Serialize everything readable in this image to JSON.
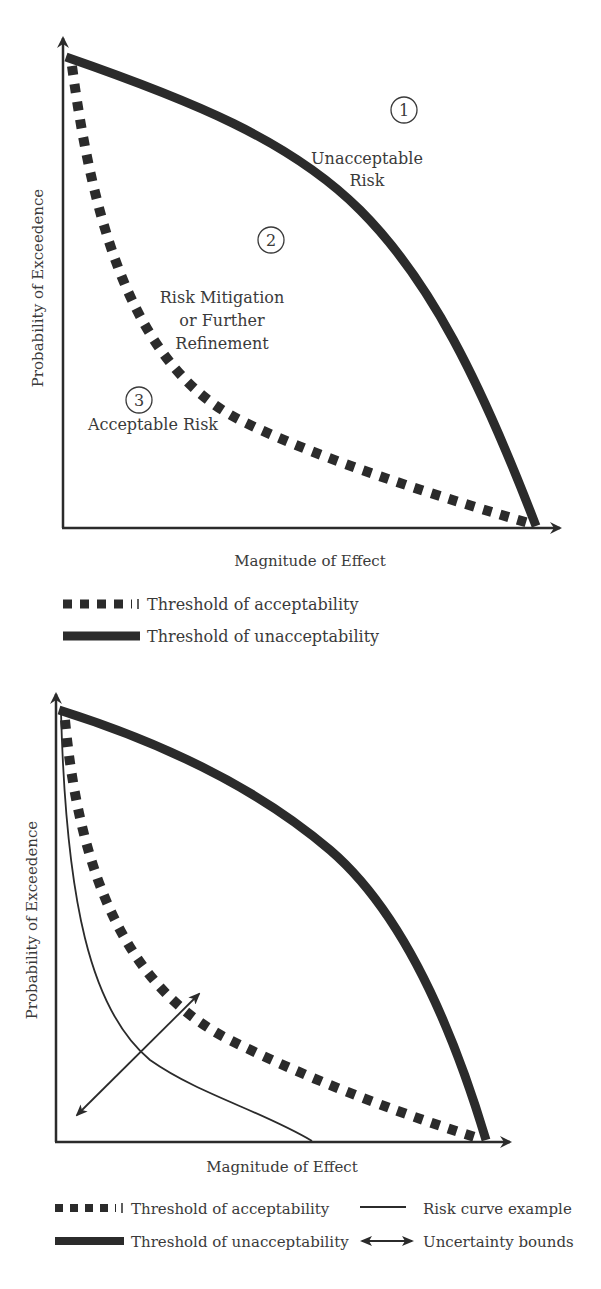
{
  "figure_top": {
    "y_axis_label": "Probability of Exceedence",
    "x_axis_label": "Magnitude of Effect",
    "regions": [
      {
        "number": "1",
        "label_line1": "Unacceptable",
        "label_line2": "Risk"
      },
      {
        "number": "2",
        "label_line1": "Risk Mitigation",
        "label_line2": "or Further",
        "label_line3": "Refinement"
      },
      {
        "number": "3",
        "label_line1": "Acceptable Risk"
      }
    ],
    "legend": [
      {
        "style": "dotted-thick",
        "label": "Threshold of acceptability"
      },
      {
        "style": "solid-thick",
        "label": "Threshold of unacceptability"
      }
    ]
  },
  "figure_bottom": {
    "y_axis_label": "Probability of Exceedence",
    "x_axis_label": "Magnitude of Effect",
    "legend": [
      {
        "style": "dotted-thick",
        "label": "Threshold of acceptability"
      },
      {
        "style": "solid-thick",
        "label": "Threshold of unacceptability"
      },
      {
        "style": "thin-line",
        "label": "Risk curve example"
      },
      {
        "style": "double-arrow",
        "label": "Uncertainty bounds"
      }
    ]
  },
  "colors": {
    "line": "#2b2b2b",
    "text": "#3a3a3a",
    "background": "#ffffff"
  }
}
